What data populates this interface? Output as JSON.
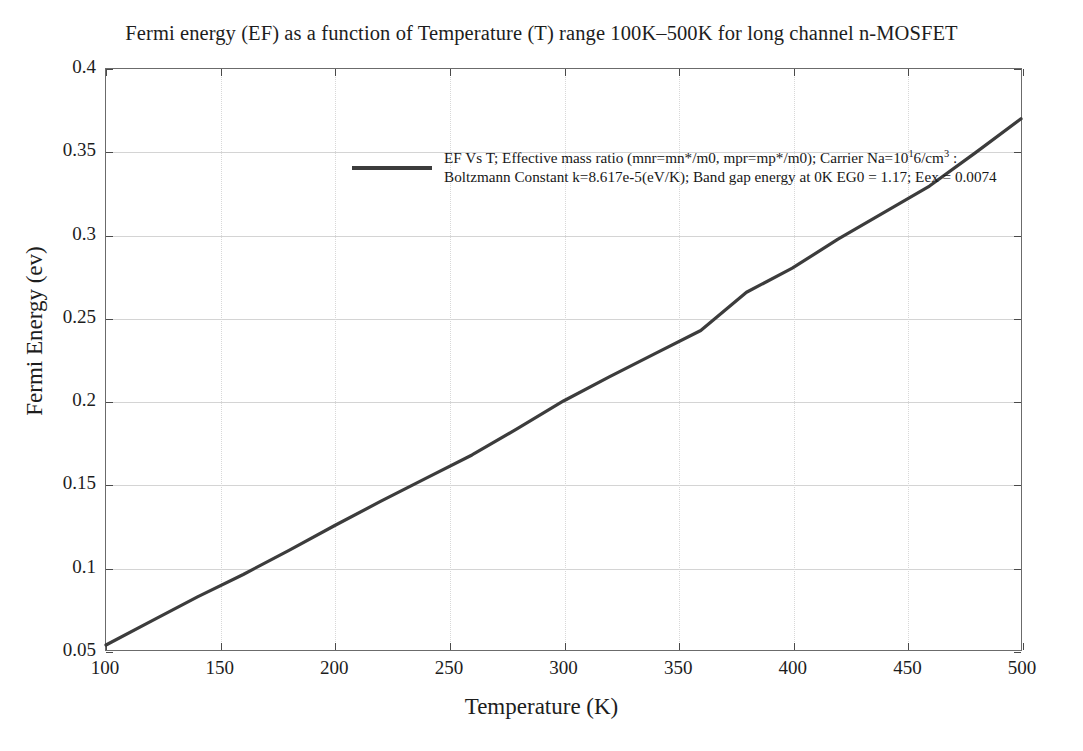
{
  "chart_data": {
    "type": "line",
    "title": "Fermi energy (EF) as a function of Temperature (T) range 100K–500K for long channel n-MOSFET",
    "xlabel": "Temperature (K)",
    "ylabel": "Fermi Energy (ev)",
    "xlim": [
      100,
      500
    ],
    "ylim": [
      0.05,
      0.4
    ],
    "xticks": [
      100,
      150,
      200,
      250,
      300,
      350,
      400,
      450,
      500
    ],
    "xtick_labels": [
      "100",
      "150",
      "200",
      "250",
      "300",
      "350",
      "400",
      "450",
      "500"
    ],
    "yticks": [
      0.05,
      0.1,
      0.15,
      0.2,
      0.25,
      0.3,
      0.35,
      0.4
    ],
    "ytick_labels": [
      "0.05",
      "0.1",
      "0.15",
      "0.2",
      "0.25",
      "0.3",
      "0.35",
      "0.4"
    ],
    "grid": true,
    "legend_position": "top-center",
    "series": [
      {
        "name": "EF Vs T",
        "color": "#3c3c3c",
        "linewidth": 3,
        "x": [
          100,
          120,
          140,
          160,
          180,
          200,
          220,
          240,
          260,
          280,
          300,
          320,
          340,
          360,
          380,
          400,
          420,
          440,
          460,
          480,
          500
        ],
        "y": [
          0.053,
          0.0675,
          0.082,
          0.0955,
          0.11,
          0.125,
          0.1395,
          0.1535,
          0.1675,
          0.1835,
          0.2,
          0.2145,
          0.2285,
          0.2425,
          0.2655,
          0.28,
          0.2975,
          0.3135,
          0.3295,
          0.3495,
          0.37
        ]
      }
    ]
  },
  "legend": {
    "swatch_color": "#3c3c3c",
    "line1_a": "EF Vs T; Effective mass ratio (mnr=mn*/m0, mpr=mp*/m0); Carrier Na=10",
    "line1_sup": "1",
    "line1_b": "6/cm",
    "line1_sup2": "3",
    "line1_c": " :",
    "line2": "Boltzmann Constant k=8.617e-5(eV/K); Band gap energy at 0K EG0 = 1.17; Eex = 0.0074"
  }
}
